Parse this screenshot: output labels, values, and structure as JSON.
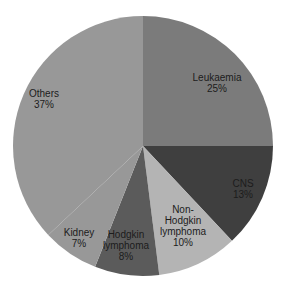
{
  "chart_data": {
    "type": "pie",
    "title": "",
    "start_angle_deg": 0,
    "direction": "clockwise",
    "center": [
      143,
      146
    ],
    "radius": 130,
    "slices": [
      {
        "label": "Leukaemia",
        "label_lines": [
          "Leukaemia"
        ],
        "value": 25,
        "value_label": "25%",
        "color": "#7b7b7b",
        "label_pos": [
          217,
          83
        ]
      },
      {
        "label": "CNS",
        "label_lines": [
          "CNS"
        ],
        "value": 13,
        "value_label": "13%",
        "color": "#3f3f3f",
        "label_pos": [
          243,
          189
        ]
      },
      {
        "label": "Non-Hodgkin lymphoma",
        "label_lines": [
          "Non-",
          "Hodgkin",
          "lymphoma"
        ],
        "value": 10,
        "value_label": "10%",
        "color": "#b4b4b4",
        "label_pos": [
          183,
          226
        ]
      },
      {
        "label": "Hodgkin lymphoma",
        "label_lines": [
          "Hodgkin",
          "lymphoma"
        ],
        "value": 8,
        "value_label": "8%",
        "color": "#5b5b5b",
        "label_pos": [
          126,
          245
        ]
      },
      {
        "label": "Kidney",
        "label_lines": [
          "Kidney"
        ],
        "value": 7,
        "value_label": "7%",
        "color": "#989898",
        "label_pos": [
          79,
          238
        ]
      },
      {
        "label": "Others",
        "label_lines": [
          "Others"
        ],
        "value": 37,
        "value_label": "37%",
        "color": "#989898",
        "label_pos": [
          44,
          99
        ]
      }
    ],
    "legend": "none",
    "grid": false
  }
}
